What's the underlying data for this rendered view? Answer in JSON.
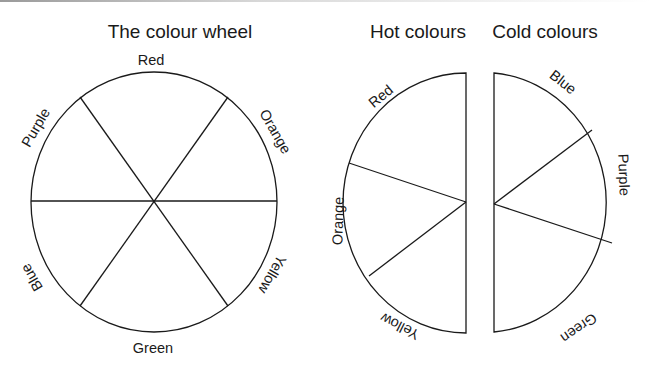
{
  "diagrams": {
    "wheel": {
      "title": "The colour wheel",
      "segments": [
        "Red",
        "Orange",
        "Yellow",
        "Green",
        "Blue",
        "Purple"
      ]
    },
    "hot": {
      "title": "Hot colours",
      "segments": [
        "Red",
        "Orange",
        "Yellow"
      ]
    },
    "cold": {
      "title": "Cold colours",
      "segments": [
        "Blue",
        "Purple",
        "Green"
      ]
    }
  },
  "colors": {
    "stroke": "#1a1a1a",
    "background": "#ffffff"
  }
}
